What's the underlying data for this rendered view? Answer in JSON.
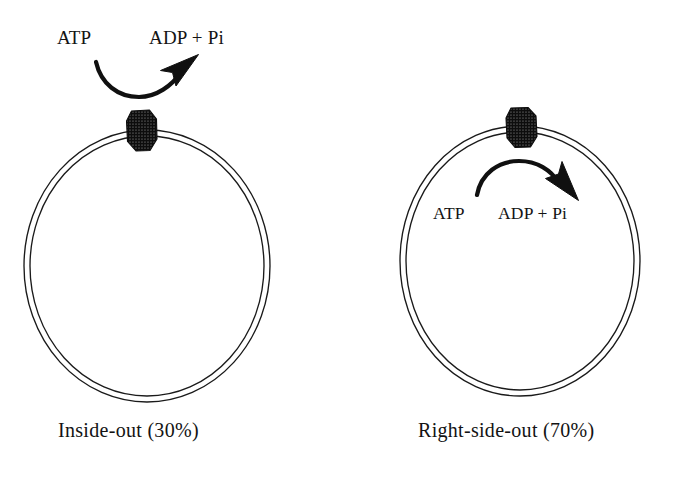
{
  "figure": {
    "background_color": "#ffffff",
    "ink_color": "#131313",
    "membrane_stroke_color": "#1a1a1a",
    "enzyme_fill_color": "#111111"
  },
  "panels": [
    {
      "id": "inside-out",
      "caption": "Inside-out (30%)",
      "percentage": "30%",
      "orientation_name": "Inside-out",
      "reaction": {
        "substrate": "ATP",
        "products": "ADP + Pi",
        "arrow_location": "outside-vesicle",
        "arrow_direction": "up-right",
        "arrow_shape": "concave-down-swoop"
      },
      "enzyme": {
        "name": "ATPase particle",
        "texture": "stippled",
        "position": "top-of-membrane",
        "facing": "outward"
      },
      "vesicle": {
        "shape": "double-line-ellipse",
        "membrane_layers": 2
      }
    },
    {
      "id": "right-side-out",
      "caption": "Right-side-out (70%)",
      "percentage": "70%",
      "orientation_name": "Right-side-out",
      "reaction": {
        "substrate": "ATP",
        "products": "ADP + Pi",
        "arrow_location": "inside-vesicle",
        "arrow_direction": "down-right",
        "arrow_shape": "convex-up-arch"
      },
      "enzyme": {
        "name": "ATPase particle",
        "texture": "stippled",
        "position": "top-of-membrane",
        "facing": "inward"
      },
      "vesicle": {
        "shape": "double-line-ellipse",
        "membrane_layers": 2
      }
    }
  ]
}
